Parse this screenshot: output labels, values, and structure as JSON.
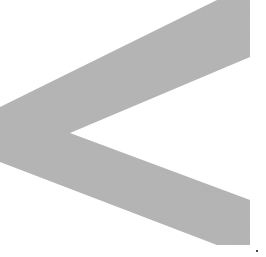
{
  "canvas": {
    "width": 266,
    "height": 257,
    "background_color": "#ffffff",
    "title": "chevron-left-glyph"
  },
  "graphic": {
    "name": "chevron-left-icon",
    "description": "Large gray left-pointing chevron / less-than arrow, clipped at the left edge of the frame",
    "fill_color": "#b6b6b6",
    "stroke": "none",
    "noise_texture": true,
    "points": "217,0 250,0 250,57 70,133 250,200 250,245 217,245 0,162 0,107",
    "vertices": {
      "top_arm_top_left": [
        217,
        0
      ],
      "top_arm_top_right": [
        250,
        0
      ],
      "top_arm_right_bottom": [
        250,
        57
      ],
      "inner_vertex": [
        70,
        133
      ],
      "bottom_arm_right_top": [
        250,
        200
      ],
      "bottom_arm_right_bottom": [
        250,
        245
      ],
      "bottom_arm_bottom_left": [
        217,
        245
      ],
      "left_tip_bottom": [
        0,
        162
      ],
      "left_tip_top": [
        0,
        107
      ]
    }
  },
  "artifact": {
    "name": "dust-speck",
    "color": "#4a4a4a",
    "position": [
      256,
      250
    ],
    "size": [
      2,
      2
    ]
  }
}
